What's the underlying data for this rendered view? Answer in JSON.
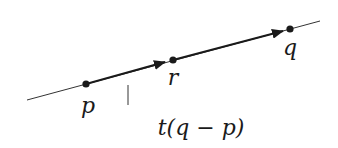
{
  "diagram": {
    "type": "vector-line-parametrization",
    "colors": {
      "background": "#ffffff",
      "ink": "#1a1a1a",
      "thin_line": "#333333"
    },
    "line": {
      "x1": 27,
      "y1": 100,
      "x2": 320,
      "y2": 21
    },
    "points": [
      {
        "id": "p",
        "label": "p",
        "x": 86,
        "y": 84,
        "label_x": 88,
        "label_y": 113
      },
      {
        "id": "r",
        "label": "r",
        "x": 173,
        "y": 60,
        "label_x": 173,
        "label_y": 85
      },
      {
        "id": "q",
        "label": "q",
        "x": 290,
        "y": 29,
        "label_x": 290,
        "label_y": 55
      }
    ],
    "vectors": [
      {
        "from": "p",
        "to": "r"
      },
      {
        "from": "r",
        "to": "q"
      }
    ],
    "tick": {
      "x": 128,
      "y1": 85,
      "y2": 105
    },
    "annotation": {
      "text": "t(q − p)",
      "x": 201,
      "y": 135
    }
  }
}
